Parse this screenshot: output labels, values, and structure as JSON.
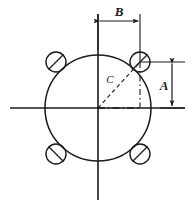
{
  "drawing": {
    "title": "Bolt Circle Hole Pattern Dimension Diagram",
    "background_color": "#ffffff",
    "line_color": "#1a1a1a",
    "canvas": {
      "width": 196,
      "height": 206
    },
    "labels": {
      "b_dimension": "B",
      "a_dimension": "A",
      "c_radius": "C"
    },
    "geometry": {
      "center": {
        "x": 98,
        "y": 108
      },
      "main_circle_radius": 53,
      "hole_radius": 10,
      "holes": [
        {
          "name": "hole-upper-right",
          "x": 140,
          "y": 62
        },
        {
          "name": "hole-upper-left",
          "x": 56,
          "y": 62
        },
        {
          "name": "hole-lower-right",
          "x": 140,
          "y": 154
        },
        {
          "name": "hole-lower-left",
          "x": 56,
          "y": 154
        }
      ],
      "horizontal_centerline": {
        "x1": 10,
        "y1": 108,
        "x2": 185,
        "y2": 108
      },
      "vertical_centerline": {
        "x1": 98,
        "y1": 14,
        "x2": 98,
        "y2": 200
      },
      "b_dimension_line": {
        "x1": 98,
        "y": 21,
        "x2": 140
      },
      "a_dimension_line": {
        "x": 172,
        "y1": 62,
        "y2": 107
      }
    }
  }
}
